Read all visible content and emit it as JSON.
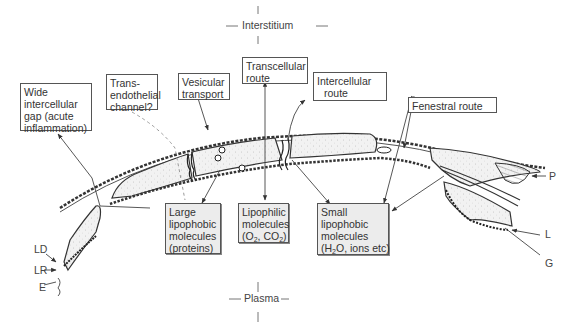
{
  "compartments": {
    "top": "Interstitium",
    "bottom": "Plasma"
  },
  "routes": [
    {
      "id": "wide-gap",
      "label_lines": [
        "Wide",
        "intercellular",
        "gap (acute",
        "inflammation)"
      ]
    },
    {
      "id": "trans-endothelial",
      "label_lines": [
        "Trans-",
        "endothelial",
        "channel?"
      ]
    },
    {
      "id": "vesicular",
      "label_lines": [
        "Vesicular",
        "transport"
      ]
    },
    {
      "id": "transcellular",
      "label_lines": [
        "Transcellular",
        "route"
      ]
    },
    {
      "id": "intercellular",
      "label_lines": [
        "Intercellular",
        "route"
      ]
    },
    {
      "id": "fenestral",
      "label_lines": [
        "Fenestral route"
      ]
    }
  ],
  "molecules": [
    {
      "id": "large-lipophobic",
      "lines": [
        "Large",
        "lipophobic",
        "molecules",
        "(proteins)"
      ]
    },
    {
      "id": "lipophilic",
      "lines": [
        "Lipophilic",
        "molecules"
      ],
      "formula": {
        "pre": "(O",
        "sub1": "2",
        "mid": ", CO",
        "sub2": "2",
        "post": ")"
      }
    },
    {
      "id": "small-lipophobic",
      "lines": [
        "Small",
        "lipophobic",
        "molecules"
      ],
      "formula": {
        "pre": "(H",
        "sub1": "2",
        "mid": "O, ions etc)"
      }
    }
  ],
  "structure_labels": {
    "LD": "LD",
    "LR": "LR",
    "E": "E",
    "P": "P",
    "L": "L",
    "G": "G"
  }
}
